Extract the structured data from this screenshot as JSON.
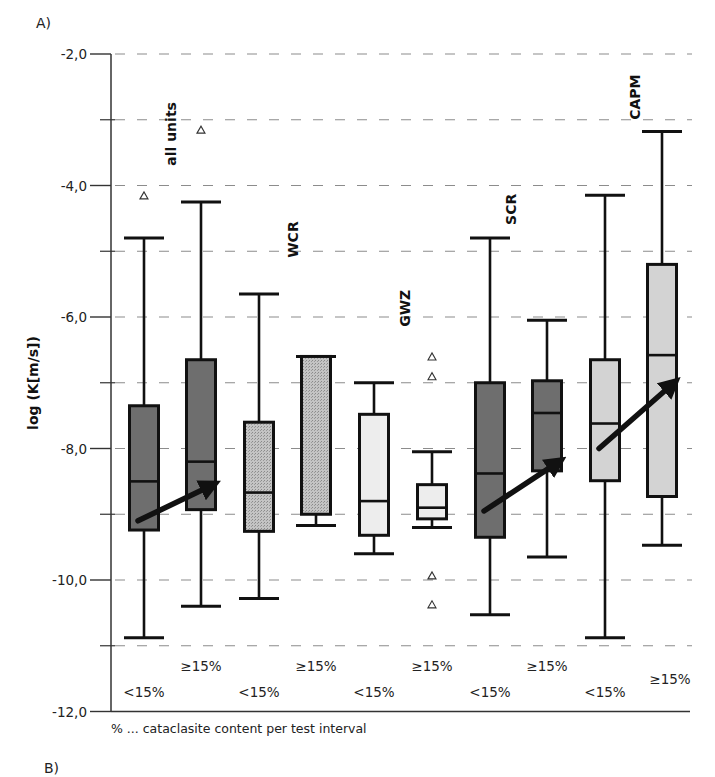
{
  "panel_labels": {
    "top": "A)",
    "bottom": "B)"
  },
  "footnote": "% ... cataclasite content per test interval",
  "chart_data": {
    "type": "boxplot",
    "title": "",
    "xlabel": "",
    "ylabel": "log (K[m/s])",
    "ylim": [
      -12.0,
      -2.0
    ],
    "yticks": [
      -2.0,
      -4.0,
      -6.0,
      -8.0,
      -10.0,
      -12.0
    ],
    "ytick_labels": [
      "-2,0",
      "-4,0",
      "-6,0",
      "-8,0",
      "-10,0",
      "-12,0"
    ],
    "minor_yticks": [
      -3.0,
      -5.0,
      -7.0,
      -9.0,
      -11.0
    ],
    "grid": {
      "y": true,
      "style": "dashed",
      "at": [
        -2,
        -3,
        -4,
        -5,
        -6,
        -7,
        -8,
        -9,
        -10,
        -11
      ]
    },
    "legend": null,
    "groups": [
      {
        "name": "all units",
        "label_y": -3.7,
        "color": "#6e6e6e"
      },
      {
        "name": "WCR",
        "label_y": -5.1,
        "color": "#b5b5b5"
      },
      {
        "name": "GWZ",
        "label_y": -6.15,
        "color": "#ededed"
      },
      {
        "name": "SCR",
        "label_y": -4.6,
        "color": "#6e6e6e"
      },
      {
        "name": "CAPM",
        "label_y": -3.0,
        "color": "#d3d3d3"
      }
    ],
    "boxes": [
      {
        "group": "all units",
        "category": "<15%",
        "whisker_high": -4.8,
        "q3": -7.35,
        "median": -8.5,
        "q1": -9.24,
        "whisker_low": -10.88,
        "outliers": [
          -4.15
        ]
      },
      {
        "group": "all units",
        "category": "≥15%",
        "whisker_high": -4.25,
        "q3": -6.65,
        "median": -8.2,
        "q1": -8.93,
        "whisker_low": -10.4,
        "outliers": [
          -3.15
        ]
      },
      {
        "group": "WCR",
        "category": "<15%",
        "whisker_high": -5.65,
        "q3": -7.6,
        "median": -8.67,
        "q1": -9.26,
        "whisker_low": -10.28,
        "outliers": []
      },
      {
        "group": "WCR",
        "category": "≥15%",
        "whisker_high": -6.6,
        "q3": -6.6,
        "median": null,
        "q1": -9.0,
        "whisker_low": -9.17,
        "outliers": []
      },
      {
        "group": "GWZ",
        "category": "<15%",
        "whisker_high": -7.0,
        "q3": -7.48,
        "median": -8.8,
        "q1": -9.32,
        "whisker_low": -9.6,
        "outliers": []
      },
      {
        "group": "GWZ",
        "category": "≥15%",
        "whisker_high": -8.05,
        "q3": -8.55,
        "median": -8.9,
        "q1": -9.07,
        "whisker_low": -9.2,
        "outliers": [
          -6.6,
          -6.9,
          -9.93,
          -10.37
        ]
      },
      {
        "group": "SCR",
        "category": "<15%",
        "whisker_high": -4.8,
        "q3": -7.0,
        "median": -8.38,
        "q1": -9.35,
        "whisker_low": -10.53,
        "outliers": []
      },
      {
        "group": "SCR",
        "category": "≥15%",
        "whisker_high": -6.05,
        "q3": -6.97,
        "median": -7.46,
        "q1": -8.34,
        "whisker_low": -9.65,
        "outliers": []
      },
      {
        "group": "CAPM",
        "category": "<15%",
        "whisker_high": -4.15,
        "q3": -6.65,
        "median": -7.62,
        "q1": -8.49,
        "whisker_low": -10.88,
        "outliers": []
      },
      {
        "group": "CAPM",
        "category": "≥15%",
        "whisker_high": -3.18,
        "q3": -5.2,
        "median": -6.58,
        "q1": -8.73,
        "whisker_low": -9.47,
        "outliers": []
      }
    ],
    "annotations": [
      {
        "type": "arrow",
        "group": "all units",
        "from": {
          "box": 0,
          "y": -9.1
        },
        "to": {
          "box": 1,
          "y": -8.55
        }
      },
      {
        "type": "arrow",
        "group": "SCR",
        "from": {
          "box": 6,
          "y": -8.95
        },
        "to": {
          "box": 7,
          "y": -8.2
        }
      },
      {
        "type": "arrow",
        "group": "CAPM",
        "from": {
          "box": 8,
          "y": -8.0
        },
        "to": {
          "box": 9,
          "y": -7.0
        }
      }
    ],
    "category_labels": [
      {
        "text": "<15%",
        "y_offset": 1
      },
      {
        "text": "≥15%",
        "y_offset": 0
      },
      {
        "text": "<15%",
        "y_offset": 1
      },
      {
        "text": "≥15%",
        "y_offset": 0
      },
      {
        "text": "<15%",
        "y_offset": 1
      },
      {
        "text": "≥15%",
        "y_offset": 0
      },
      {
        "text": "<15%",
        "y_offset": 1
      },
      {
        "text": "≥15%",
        "y_offset": 0
      },
      {
        "text": "<15%",
        "y_offset": 1
      },
      {
        "text": "≥15%",
        "y_offset": 0.5
      }
    ]
  }
}
